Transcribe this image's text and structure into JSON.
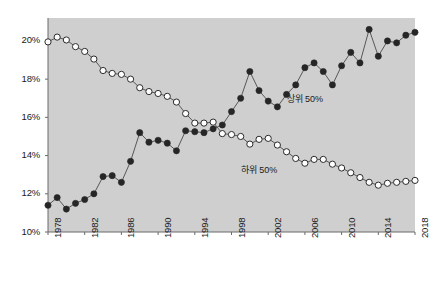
{
  "chart_data": {
    "type": "line",
    "title": "",
    "subtitle": "",
    "xlabel": "",
    "ylabel": "",
    "xlim": [
      1978,
      2018
    ],
    "ylim": [
      10,
      21.2
    ],
    "ytick_values": [
      10,
      12,
      14,
      16,
      18,
      20
    ],
    "ytick_labels": [
      "10%",
      "12%",
      "14%",
      "16%",
      "18%",
      "20%"
    ],
    "xtick_values": [
      1978,
      1982,
      1986,
      1990,
      1994,
      1998,
      2002,
      2006,
      2010,
      2014,
      2018
    ],
    "xtick_labels": [
      "1978",
      "1982",
      "1986",
      "1990",
      "1994",
      "1998",
      "2002",
      "2006",
      "2010",
      "2014",
      "2018"
    ],
    "grid": false,
    "legend_position": "inline-annotation",
    "plot_background": "#cfcfcf",
    "x": [
      1978,
      1979,
      1980,
      1981,
      1982,
      1983,
      1984,
      1985,
      1986,
      1987,
      1988,
      1989,
      1990,
      1991,
      1992,
      1993,
      1994,
      1995,
      1996,
      1997,
      1998,
      1999,
      2000,
      2001,
      2002,
      2003,
      2004,
      2005,
      2006,
      2007,
      2008,
      2009,
      2010,
      2011,
      2012,
      2013,
      2014,
      2015,
      2016,
      2017,
      2018
    ],
    "series": [
      {
        "name": "상위 50%",
        "marker": "filled-circle",
        "color": "#262626",
        "values": [
          11.4,
          11.8,
          11.2,
          11.5,
          11.7,
          12.0,
          12.9,
          12.95,
          12.6,
          13.7,
          15.2,
          14.7,
          14.8,
          14.65,
          14.25,
          15.3,
          15.25,
          15.2,
          15.4,
          15.6,
          16.3,
          17.0,
          18.4,
          17.4,
          16.85,
          16.55,
          17.2,
          17.7,
          18.6,
          18.85,
          18.4,
          17.7,
          18.7,
          19.4,
          18.85,
          20.6,
          19.2,
          20.0,
          19.9,
          20.3,
          20.45
        ]
      },
      {
        "name": "하위 50%",
        "marker": "open-circle",
        "color": "#ffffff",
        "values": [
          19.95,
          20.2,
          20.05,
          19.7,
          19.45,
          19.05,
          18.45,
          18.3,
          18.25,
          18.0,
          17.55,
          17.35,
          17.25,
          17.1,
          16.8,
          16.2,
          15.7,
          15.7,
          15.75,
          15.15,
          15.1,
          15.0,
          14.6,
          14.85,
          14.9,
          14.55,
          14.2,
          13.85,
          13.6,
          13.8,
          13.8,
          13.55,
          13.35,
          13.1,
          12.85,
          12.6,
          12.45,
          12.55,
          12.6,
          12.65,
          12.7
        ]
      }
    ],
    "annotations": [
      {
        "text": "상위 50%",
        "x": 2004,
        "y": 17.0
      },
      {
        "text": "하위 50%",
        "x": 1999,
        "y": 13.3
      }
    ]
  }
}
